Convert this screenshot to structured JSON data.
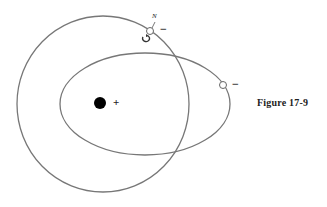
{
  "figure": {
    "caption": "Figure 17-9"
  },
  "diagram": {
    "nucleus": {
      "charge_label": "+",
      "color": "#000000"
    },
    "electrons": [
      {
        "id": "electron-on-circular-orbit",
        "charge_label": "−",
        "magnetic_pole_label": "N",
        "has_spin_arrow": true
      },
      {
        "id": "electron-on-elliptical-orbit",
        "charge_label": "−"
      }
    ],
    "orbits": [
      {
        "type": "circle",
        "stroke": "#777777"
      },
      {
        "type": "ellipse",
        "stroke": "#777777"
      }
    ]
  }
}
